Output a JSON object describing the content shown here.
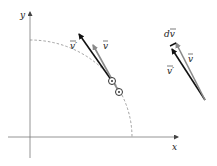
{
  "diagram": {
    "axes": {
      "x_label": "x",
      "y_label": "y"
    },
    "left_figure": {
      "vector_v_label": "v",
      "vector_v_prime_label": "v′",
      "circle_points": 2
    },
    "right_figure": {
      "vector_v_label": "v",
      "vector_v_prime_label": "v′",
      "difference_label": "dv"
    },
    "colors": {
      "v_prime": "#111111",
      "v": "#8a8a8a",
      "axis": "#7a7a7a",
      "arc": "#8a8a8a"
    }
  }
}
